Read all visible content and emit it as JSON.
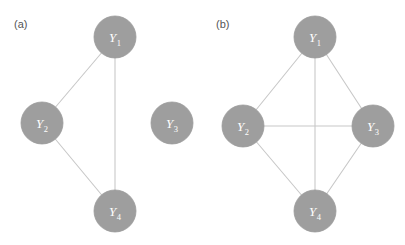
{
  "figure": {
    "background_color": "#ffffff",
    "node_fill_color": "#9e9e9e",
    "node_stroke_color": "#8f8f8f",
    "edge_color": "#c8c8c8",
    "label_color": "#ffffff",
    "panel_label_color": "#555555",
    "node_radius": 21,
    "edge_width": 1.1
  },
  "panels": [
    {
      "id": "panel-a",
      "label": "(a)",
      "label_x": 14,
      "label_y": 28,
      "nodes": [
        {
          "id": "Y1",
          "symbol": "Y",
          "subscript": "1",
          "cx": 115,
          "cy": 37
        },
        {
          "id": "Y2",
          "symbol": "Y",
          "subscript": "2",
          "cx": 42,
          "cy": 123
        },
        {
          "id": "Y3",
          "symbol": "Y",
          "subscript": "3",
          "cx": 172,
          "cy": 123
        },
        {
          "id": "Y4",
          "symbol": "Y",
          "subscript": "4",
          "cx": 115,
          "cy": 211
        }
      ],
      "edges": [
        {
          "from": "Y1",
          "to": "Y2"
        },
        {
          "from": "Y1",
          "to": "Y4"
        },
        {
          "from": "Y2",
          "to": "Y4"
        }
      ],
      "isolated_nodes": [
        "Y3"
      ]
    },
    {
      "id": "panel-b",
      "label": "(b)",
      "label_x": 216,
      "label_y": 28,
      "nodes": [
        {
          "id": "Y1",
          "symbol": "Y",
          "subscript": "1",
          "cx": 315,
          "cy": 37
        },
        {
          "id": "Y2",
          "symbol": "Y",
          "subscript": "2",
          "cx": 243,
          "cy": 126
        },
        {
          "id": "Y3",
          "symbol": "Y",
          "subscript": "3",
          "cx": 373,
          "cy": 126
        },
        {
          "id": "Y4",
          "symbol": "Y",
          "subscript": "4",
          "cx": 315,
          "cy": 211
        }
      ],
      "edges": [
        {
          "from": "Y1",
          "to": "Y2"
        },
        {
          "from": "Y1",
          "to": "Y3"
        },
        {
          "from": "Y1",
          "to": "Y4"
        },
        {
          "from": "Y2",
          "to": "Y3"
        },
        {
          "from": "Y2",
          "to": "Y4"
        },
        {
          "from": "Y3",
          "to": "Y4"
        }
      ],
      "isolated_nodes": []
    }
  ]
}
